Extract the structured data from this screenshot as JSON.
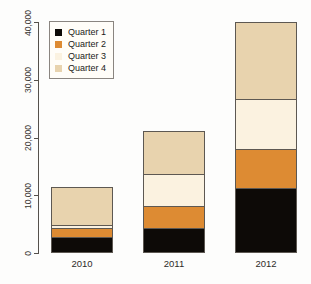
{
  "chart_data": {
    "type": "bar",
    "subtype": "stacked-bar",
    "title": "",
    "xlabel": "",
    "ylabel": "",
    "categories": [
      "2010",
      "2011",
      "2012"
    ],
    "ylim": [
      0,
      40000
    ],
    "yticks": [
      0,
      10000,
      20000,
      30000,
      40000
    ],
    "ytick_labels": [
      "0",
      "10,000",
      "20,000",
      "30,000",
      "40,000"
    ],
    "grid": false,
    "legend_position": "top-left",
    "series": [
      {
        "name": "Quarter 1",
        "color": "#0d0a07",
        "values": [
          2800,
          4300,
          11250
        ]
      },
      {
        "name": "Quarter 2",
        "color": "#dd8b33",
        "values": [
          1700,
          4000,
          6950
        ]
      },
      {
        "name": "Quarter 3",
        "color": "#fbf2e0",
        "values": [
          700,
          5700,
          8800
        ]
      },
      {
        "name": "Quarter 4",
        "color": "#e8d3ae",
        "values": [
          6800,
          7600,
          13500
        ]
      }
    ],
    "totals": [
      12000,
      21600,
      40500
    ]
  },
  "legend": {
    "items": [
      {
        "label": "Quarter 1",
        "color": "#0d0a07"
      },
      {
        "label": "Quarter 2",
        "color": "#dd8b33"
      },
      {
        "label": "Quarter 3",
        "color": "#fbf2e0"
      },
      {
        "label": "Quarter 4",
        "color": "#e8d3ae"
      }
    ]
  }
}
